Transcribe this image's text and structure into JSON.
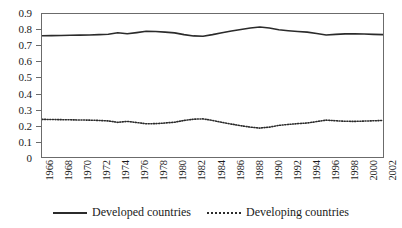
{
  "chart_data": {
    "type": "line",
    "title": "",
    "subtitle": "",
    "xlabel": "",
    "ylabel": "",
    "xlim": [
      1966,
      2002
    ],
    "ylim": [
      0,
      0.9
    ],
    "grid": false,
    "legend_position": "bottom",
    "y_ticks": [
      "0.9",
      "0.8",
      "0.7",
      "0.6",
      "0.5",
      "0.4",
      "0.3",
      "0.2",
      "0.1",
      "0"
    ],
    "y_tick_values": [
      0.9,
      0.8,
      0.7,
      0.6,
      0.5,
      0.4,
      0.3,
      0.2,
      0.1,
      0
    ],
    "x_tick_labels": [
      "1966",
      "1968",
      "1970",
      "1972",
      "1974",
      "1976",
      "1978",
      "1980",
      "1982",
      "1984",
      "1986",
      "1988",
      "1990",
      "1992",
      "1994",
      "1996",
      "1998",
      "2000",
      "2002"
    ],
    "x": [
      1966,
      1967,
      1968,
      1969,
      1970,
      1971,
      1972,
      1973,
      1974,
      1975,
      1976,
      1977,
      1978,
      1979,
      1980,
      1981,
      1982,
      1983,
      1984,
      1985,
      1986,
      1987,
      1988,
      1989,
      1990,
      1991,
      1992,
      1993,
      1994,
      1995,
      1996,
      1997,
      1998,
      1999,
      2000,
      2001,
      2002
    ],
    "series": [
      {
        "name": "Developed countries",
        "style": "solid",
        "color": "#2b2b2b",
        "values": [
          0.763,
          0.764,
          0.765,
          0.766,
          0.767,
          0.768,
          0.77,
          0.773,
          0.782,
          0.776,
          0.783,
          0.791,
          0.79,
          0.786,
          0.781,
          0.77,
          0.762,
          0.76,
          0.77,
          0.782,
          0.793,
          0.803,
          0.812,
          0.818,
          0.812,
          0.801,
          0.795,
          0.79,
          0.786,
          0.777,
          0.768,
          0.772,
          0.775,
          0.776,
          0.774,
          0.772,
          0.77
        ]
      },
      {
        "name": "Developing countries",
        "style": "dotted",
        "color": "#2b2b2b",
        "values": [
          0.237,
          0.236,
          0.235,
          0.234,
          0.233,
          0.232,
          0.23,
          0.227,
          0.218,
          0.224,
          0.217,
          0.209,
          0.21,
          0.214,
          0.219,
          0.23,
          0.238,
          0.24,
          0.23,
          0.218,
          0.207,
          0.197,
          0.188,
          0.182,
          0.188,
          0.199,
          0.205,
          0.21,
          0.214,
          0.223,
          0.232,
          0.228,
          0.225,
          0.224,
          0.226,
          0.228,
          0.23
        ]
      }
    ]
  },
  "legend": {
    "entries": [
      {
        "label": "Developed countries",
        "marker": "solid-line-swatch"
      },
      {
        "label": "Developing countries",
        "marker": "dotted-line-swatch"
      }
    ]
  }
}
